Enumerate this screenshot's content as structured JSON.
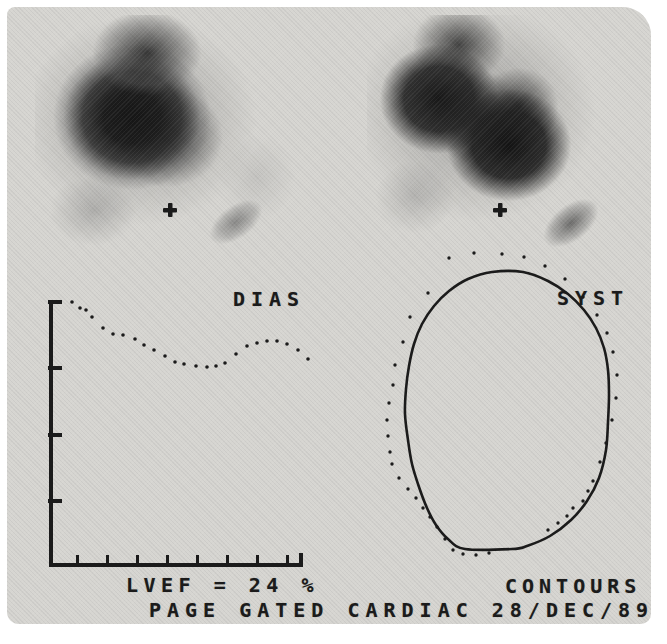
{
  "window": {
    "description": "Gated cardiac blood-pool study page from a nuclear medicine computer",
    "bg": "#d6d5d1",
    "ink": "#1b1b1b"
  },
  "labels": {
    "dias": "DIAS",
    "syst": "SYST",
    "lvef": "LVEF = 24 %",
    "contours": "CONTOURS",
    "footer": "PAGE GATED CARDIAC 28/DEC/89"
  },
  "chart_data": {
    "type": "scatter",
    "annotations": [
      "DIAS",
      "LVEF = 24 %"
    ],
    "lvef_percent": 24,
    "units": "screen_px",
    "points_px": [
      [
        72,
        302
      ],
      [
        80,
        308
      ],
      [
        86,
        310
      ],
      [
        92,
        317
      ],
      [
        103,
        328
      ],
      [
        113,
        334
      ],
      [
        123,
        335
      ],
      [
        135,
        339
      ],
      [
        144,
        345
      ],
      [
        154,
        350
      ],
      [
        165,
        356
      ],
      [
        175,
        362
      ],
      [
        184,
        364
      ],
      [
        196,
        366
      ],
      [
        207,
        367
      ],
      [
        216,
        366
      ],
      [
        225,
        363
      ],
      [
        236,
        354
      ],
      [
        247,
        346
      ],
      [
        257,
        343
      ],
      [
        267,
        341
      ],
      [
        277,
        341
      ],
      [
        287,
        344
      ],
      [
        298,
        350
      ],
      [
        308,
        359
      ]
    ],
    "y_axis": {
      "x": 51,
      "y1": 300,
      "y2": 567,
      "ticks_y": [
        302,
        368,
        435,
        501
      ]
    },
    "x_axis": {
      "y": 565,
      "x1": 49,
      "x2": 303,
      "ticks_x": [
        77,
        107,
        137,
        167,
        197,
        227,
        257,
        287
      ]
    }
  },
  "contours": {
    "systole_solid_px": [
      [
        492,
        272
      ],
      [
        523,
        272
      ],
      [
        548,
        281
      ],
      [
        568,
        294
      ],
      [
        584,
        310
      ],
      [
        596,
        328
      ],
      [
        604,
        348
      ],
      [
        608,
        370
      ],
      [
        609,
        395
      ],
      [
        608,
        422
      ],
      [
        606,
        450
      ],
      [
        599,
        478
      ],
      [
        587,
        501
      ],
      [
        571,
        520
      ],
      [
        550,
        536
      ],
      [
        527,
        546
      ],
      [
        512,
        549
      ],
      [
        465,
        549
      ],
      [
        448,
        539
      ],
      [
        436,
        525
      ],
      [
        427,
        508
      ],
      [
        419,
        487
      ],
      [
        412,
        464
      ],
      [
        408,
        440
      ],
      [
        405,
        414
      ],
      [
        406,
        389
      ],
      [
        409,
        366
      ],
      [
        414,
        344
      ],
      [
        422,
        324
      ],
      [
        434,
        306
      ],
      [
        449,
        291
      ],
      [
        468,
        279
      ]
    ],
    "diastole_dots_px": [
      [
        449,
        258
      ],
      [
        474,
        253
      ],
      [
        502,
        254
      ],
      [
        524,
        257
      ],
      [
        545,
        266
      ],
      [
        565,
        279
      ],
      [
        583,
        297
      ],
      [
        597,
        315
      ],
      [
        607,
        333
      ],
      [
        613,
        352
      ],
      [
        617,
        375
      ],
      [
        616,
        398
      ],
      [
        612,
        420
      ],
      [
        606,
        443
      ],
      [
        600,
        462
      ],
      [
        593,
        481
      ],
      [
        588,
        491
      ],
      [
        583,
        501
      ],
      [
        573,
        508
      ],
      [
        567,
        516
      ],
      [
        558,
        523
      ],
      [
        548,
        530
      ],
      [
        489,
        553
      ],
      [
        476,
        555
      ],
      [
        463,
        554
      ],
      [
        453,
        550
      ],
      [
        445,
        539
      ],
      [
        437,
        527
      ],
      [
        430,
        517
      ],
      [
        423,
        508
      ],
      [
        416,
        498
      ],
      [
        408,
        489
      ],
      [
        399,
        478
      ],
      [
        392,
        464
      ],
      [
        390,
        452
      ],
      [
        388,
        436
      ],
      [
        387,
        420
      ],
      [
        389,
        403
      ],
      [
        393,
        385
      ],
      [
        395,
        365
      ],
      [
        403,
        342
      ],
      [
        410,
        317
      ],
      [
        428,
        293
      ]
    ],
    "plus_markers_px": [
      [
        170,
        210
      ],
      [
        500,
        210
      ]
    ]
  }
}
